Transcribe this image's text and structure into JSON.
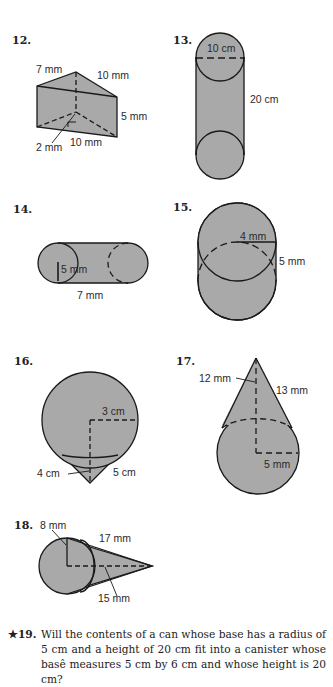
{
  "problems": [
    {
      "number": "12.",
      "shape": "triangular-prism",
      "labels": [
        "7 mm",
        "10 mm",
        "5 mm",
        "2 mm",
        "10 mm"
      ]
    },
    {
      "number": "13.",
      "shape": "cylinder",
      "labels": [
        "10 cm",
        "20 cm"
      ]
    },
    {
      "number": "14.",
      "shape": "cylinder-horizontal",
      "labels": [
        "5 mm",
        "7 mm"
      ]
    },
    {
      "number": "15.",
      "shape": "cylinder-short",
      "labels": [
        "4 mm",
        "5 mm"
      ]
    },
    {
      "number": "16.",
      "shape": "cone-inverted",
      "labels": [
        "3 cm",
        "4 cm",
        "5 cm"
      ]
    },
    {
      "number": "17.",
      "shape": "cone",
      "labels": [
        "12 mm",
        "13 mm",
        "5 mm"
      ]
    },
    {
      "number": "18.",
      "shape": "cone-horizontal",
      "labels": [
        "8 mm",
        "17 mm",
        "15 mm"
      ]
    }
  ],
  "question19": {
    "number": "★19.",
    "text": "Will the contents of a can whose base has a radius of 5 cm and a height of 20 cm fit into a canister whose basê measures 5 cm by 6 cm and whose height is 20 cm?"
  },
  "colors": {
    "fill": "#a9a9a9",
    "stroke": "#1a1a1a"
  }
}
